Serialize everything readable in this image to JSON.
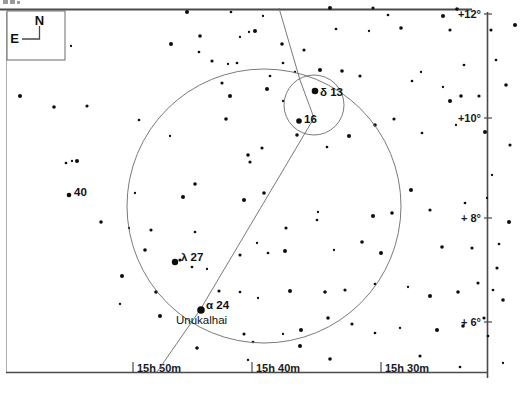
{
  "chart_data": {
    "type": "scatter",
    "title": "",
    "subtitle": "",
    "xlabel": "Right Ascension",
    "ylabel": "Declination",
    "grid": false,
    "legend": "none",
    "x_axis": {
      "position": "bottom",
      "direction": "right-to-left",
      "range": [
        "15h 55m",
        "15h 26m"
      ],
      "ticks": [
        {
          "label": "15h 50m",
          "x": 133
        },
        {
          "label": "15h 40m",
          "x": 252
        },
        {
          "label": "15h 30m",
          "x": 381
        }
      ]
    },
    "y_axis": {
      "position": "right",
      "range": [
        "+5°",
        "+12°"
      ],
      "ticks": [
        {
          "label": "+12°",
          "y": 14
        },
        {
          "label": "+10°",
          "y": 118
        },
        {
          "label": "+ 8°",
          "y": 218
        },
        {
          "label": "+ 6°",
          "y": 322
        }
      ]
    },
    "compass": {
      "north_label": "N",
      "east_label": "E",
      "north_direction": "up",
      "east_direction": "left"
    },
    "labeled_stars": [
      {
        "label": "δ 13",
        "name_label": "",
        "x": 315,
        "y": 91,
        "mag_radius": 3.3,
        "label_x": 320,
        "label_y": 96
      },
      {
        "label": "16",
        "name_label": "",
        "x": 299,
        "y": 121,
        "mag_radius": 2.8,
        "label_x": 304,
        "label_y": 123
      },
      {
        "label": "λ 27",
        "name_label": "",
        "x": 175,
        "y": 262,
        "mag_radius": 3.2,
        "label_x": 181,
        "label_y": 261
      },
      {
        "label": "α 24",
        "name_label": "Unukalhai",
        "x": 201,
        "y": 310,
        "mag_radius": 3.8,
        "label_x": 206,
        "label_y": 309,
        "name_x": 176,
        "name_y": 324
      },
      {
        "label": "40",
        "name_label": "",
        "x": 69,
        "y": 195,
        "mag_radius": 2.3,
        "label_x": 74,
        "label_y": 196
      }
    ],
    "field_circles": [
      {
        "name": "main-field-circle",
        "cx": 264,
        "cy": 206,
        "r": 137
      },
      {
        "name": "inset-field-circle",
        "cx": 314,
        "cy": 105,
        "r": 30
      }
    ],
    "object_path": {
      "name": "object-track",
      "description": "diagonal track line crossing the field",
      "points": [
        [
          279,
          8
        ],
        [
          300,
          80
        ],
        [
          314,
          118
        ],
        [
          200,
          310
        ],
        [
          157,
          372
        ]
      ]
    },
    "background_stars": [
      [
        71,
        46
      ],
      [
        171,
        44
      ],
      [
        200,
        36
      ],
      [
        212,
        61
      ],
      [
        199,
        52
      ],
      [
        228,
        64
      ],
      [
        20,
        96
      ],
      [
        54,
        107
      ],
      [
        87,
        106
      ],
      [
        139,
        120
      ],
      [
        170,
        136
      ],
      [
        230,
        96
      ],
      [
        226,
        119
      ],
      [
        250,
        162
      ],
      [
        66,
        163
      ],
      [
        72,
        161
      ],
      [
        77,
        161
      ],
      [
        195,
        184
      ],
      [
        222,
        83
      ],
      [
        237,
        63
      ],
      [
        249,
        32
      ],
      [
        255,
        31
      ],
      [
        282,
        44
      ],
      [
        304,
        50
      ],
      [
        336,
        29
      ],
      [
        369,
        31
      ],
      [
        443,
        16
      ],
      [
        401,
        28
      ],
      [
        450,
        30
      ],
      [
        283,
        63
      ],
      [
        295,
        72
      ],
      [
        330,
        8
      ],
      [
        457,
        9
      ],
      [
        491,
        30
      ],
      [
        270,
        76
      ],
      [
        283,
        101
      ],
      [
        320,
        70
      ],
      [
        342,
        71
      ],
      [
        373,
        8
      ],
      [
        388,
        15
      ],
      [
        240,
        37
      ],
      [
        267,
        89
      ],
      [
        297,
        135
      ],
      [
        360,
        76
      ],
      [
        412,
        81
      ],
      [
        443,
        87
      ],
      [
        450,
        101
      ],
      [
        461,
        96
      ],
      [
        479,
        96
      ],
      [
        464,
        65
      ],
      [
        421,
        72
      ],
      [
        349,
        136
      ],
      [
        375,
        125
      ],
      [
        394,
        119
      ],
      [
        422,
        133
      ],
      [
        456,
        125
      ],
      [
        485,
        132
      ],
      [
        248,
        155
      ],
      [
        262,
        148
      ],
      [
        327,
        147
      ],
      [
        135,
        193
      ],
      [
        183,
        197
      ],
      [
        101,
        222
      ],
      [
        151,
        230
      ],
      [
        195,
        232
      ],
      [
        129,
        228
      ],
      [
        244,
        200
      ],
      [
        264,
        193
      ],
      [
        286,
        228
      ],
      [
        317,
        220
      ],
      [
        318,
        212
      ],
      [
        373,
        216
      ],
      [
        392,
        213
      ],
      [
        430,
        210
      ],
      [
        465,
        203
      ],
      [
        487,
        198
      ],
      [
        411,
        190
      ],
      [
        362,
        242
      ],
      [
        240,
        255
      ],
      [
        268,
        253
      ],
      [
        334,
        250
      ],
      [
        381,
        253
      ],
      [
        442,
        247
      ],
      [
        472,
        248
      ],
      [
        499,
        244
      ],
      [
        257,
        243
      ],
      [
        285,
        251
      ],
      [
        145,
        250
      ],
      [
        180,
        260
      ],
      [
        192,
        267
      ],
      [
        207,
        269
      ],
      [
        122,
        276
      ],
      [
        156,
        292
      ],
      [
        219,
        291
      ],
      [
        240,
        292
      ],
      [
        258,
        298
      ],
      [
        290,
        291
      ],
      [
        325,
        292
      ],
      [
        345,
        290
      ],
      [
        375,
        284
      ],
      [
        408,
        287
      ],
      [
        430,
        296
      ],
      [
        458,
        292
      ],
      [
        478,
        283
      ],
      [
        493,
        290
      ],
      [
        120,
        304
      ],
      [
        160,
        316
      ],
      [
        197,
        348
      ],
      [
        244,
        334
      ],
      [
        253,
        342
      ],
      [
        283,
        334
      ],
      [
        301,
        330
      ],
      [
        328,
        318
      ],
      [
        352,
        324
      ],
      [
        375,
        333
      ],
      [
        400,
        328
      ],
      [
        437,
        330
      ],
      [
        463,
        326
      ],
      [
        484,
        318
      ],
      [
        488,
        336
      ],
      [
        248,
        360
      ],
      [
        300,
        346
      ],
      [
        330,
        359
      ],
      [
        420,
        356
      ],
      [
        460,
        367
      ],
      [
        503,
        363
      ],
      [
        515,
        25
      ],
      [
        506,
        85
      ],
      [
        510,
        145
      ],
      [
        496,
        60
      ],
      [
        492,
        175
      ],
      [
        509,
        222
      ],
      [
        503,
        300
      ],
      [
        497,
        268
      ],
      [
        231,
        12
      ],
      [
        263,
        16
      ],
      [
        187,
        12
      ]
    ]
  }
}
